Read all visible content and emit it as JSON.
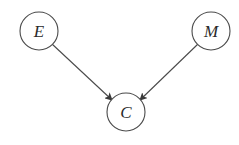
{
  "diagram": {
    "type": "directed-graph",
    "nodes": [
      {
        "id": "E",
        "label": "E",
        "cx": 39,
        "cy": 31,
        "r": 19
      },
      {
        "id": "M",
        "label": "M",
        "cx": 211,
        "cy": 31,
        "r": 19
      },
      {
        "id": "C",
        "label": "C",
        "cx": 126,
        "cy": 112,
        "r": 19
      }
    ],
    "edges": [
      {
        "from": "E",
        "to": "C"
      },
      {
        "from": "M",
        "to": "C"
      }
    ],
    "colors": {
      "stroke": "#4a4a4a",
      "text": "#2a2a2a",
      "background": "#ffffff"
    }
  }
}
